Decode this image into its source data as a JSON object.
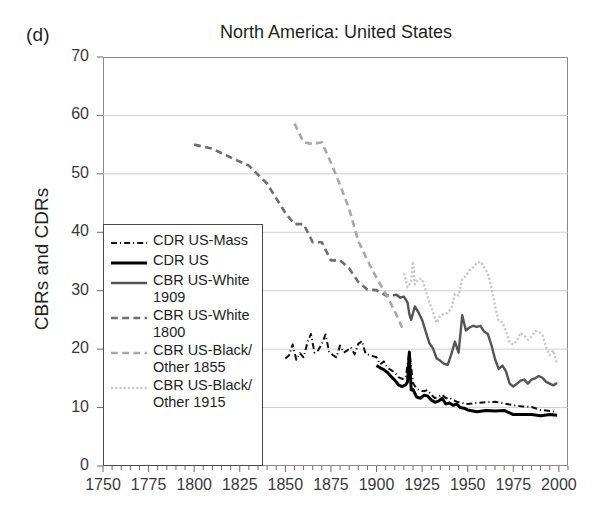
{
  "panel": {
    "label": "(d)"
  },
  "chart_data": {
    "type": "line",
    "title": "North America: United States",
    "xlabel": "",
    "ylabel": "CBRs and CDRs",
    "xlim": [
      1750,
      2005
    ],
    "ylim": [
      0,
      70
    ],
    "xticks": [
      1750,
      1775,
      1800,
      1825,
      1850,
      1875,
      1900,
      1925,
      1950,
      1975,
      2000
    ],
    "xtick_labels": [
      "1750",
      "1775",
      "1800",
      "1825",
      "1850",
      "1875",
      "1900",
      "1925",
      "1950",
      "1975",
      "2000"
    ],
    "minor_tick_step": 5,
    "yticks": [
      0,
      10,
      20,
      30,
      40,
      50,
      60,
      70
    ],
    "ytick_labels": [
      "0",
      "10",
      "20",
      "30",
      "40",
      "50",
      "60",
      "70"
    ],
    "grid": "horizontal",
    "legend_position": "lower-left-inside",
    "series": [
      {
        "name": "CDR US-Mass",
        "label": "CDR US-Mass",
        "style": "dash-dot",
        "color": "#111111",
        "width": 2.0,
        "x": [
          1850,
          1852,
          1854,
          1856,
          1858,
          1860,
          1862,
          1864,
          1866,
          1868,
          1870,
          1872,
          1874,
          1876,
          1878,
          1880,
          1882,
          1884,
          1886,
          1888,
          1890,
          1892,
          1894,
          1896,
          1898,
          1900,
          1902,
          1904,
          1906,
          1908,
          1910,
          1912,
          1914,
          1916,
          1918,
          1920,
          1922,
          1924,
          1926,
          1928,
          1930,
          1932,
          1934,
          1936,
          1938,
          1940,
          1942,
          1944,
          1946,
          1948,
          1950,
          1955,
          1960,
          1965,
          1970,
          1975,
          1980,
          1985,
          1990,
          1995,
          1999
        ],
        "y": [
          18.4,
          18.9,
          20.8,
          18.2,
          19.3,
          18.6,
          21.0,
          22.6,
          19.4,
          19.8,
          20.9,
          22.5,
          19.6,
          19.0,
          18.6,
          20.6,
          19.4,
          19.8,
          20.3,
          19.1,
          20.9,
          21.4,
          19.2,
          19.0,
          18.8,
          18.6,
          17.4,
          17.9,
          16.8,
          16.4,
          16.0,
          15.2,
          14.9,
          15.1,
          19.6,
          14.2,
          13.2,
          12.9,
          12.8,
          13.0,
          12.2,
          11.6,
          11.9,
          12.2,
          11.6,
          11.7,
          11.3,
          11.0,
          10.9,
          10.7,
          10.6,
          10.8,
          10.9,
          11.0,
          10.7,
          10.4,
          10.2,
          10.1,
          9.6,
          9.4,
          9.2
        ]
      },
      {
        "name": "CDR US",
        "label": "CDR US",
        "style": "solid",
        "color": "#000000",
        "width": 3.0,
        "x": [
          1900,
          1902,
          1904,
          1906,
          1908,
          1910,
          1912,
          1914,
          1916,
          1917,
          1918,
          1919,
          1920,
          1922,
          1924,
          1926,
          1928,
          1930,
          1932,
          1934,
          1936,
          1938,
          1940,
          1942,
          1944,
          1946,
          1948,
          1950,
          1955,
          1960,
          1965,
          1970,
          1975,
          1980,
          1985,
          1990,
          1995,
          1999
        ],
        "y": [
          17.2,
          16.8,
          16.5,
          16.0,
          15.3,
          14.7,
          13.9,
          13.6,
          13.9,
          14.4,
          19.5,
          13.0,
          13.1,
          11.8,
          11.6,
          12.1,
          12.0,
          11.3,
          10.9,
          11.1,
          11.6,
          10.6,
          10.8,
          10.4,
          10.6,
          10.0,
          9.9,
          9.6,
          9.3,
          9.5,
          9.4,
          9.5,
          8.8,
          8.8,
          8.8,
          8.6,
          8.8,
          8.7
        ]
      },
      {
        "name": "CBR US-White 1909",
        "label": "CBR US-White\n1909",
        "style": "solid",
        "color": "#555555",
        "width": 2.4,
        "x": [
          1909,
          1911,
          1913,
          1915,
          1917,
          1918,
          1919,
          1921,
          1923,
          1925,
          1927,
          1929,
          1931,
          1933,
          1935,
          1937,
          1939,
          1941,
          1943,
          1945,
          1947,
          1949,
          1951,
          1953,
          1955,
          1957,
          1959,
          1961,
          1963,
          1965,
          1967,
          1969,
          1971,
          1973,
          1975,
          1977,
          1979,
          1981,
          1983,
          1985,
          1987,
          1989,
          1991,
          1993,
          1995,
          1997,
          1999
        ],
        "y": [
          29.2,
          29.3,
          28.8,
          29.0,
          28.0,
          26.0,
          25.0,
          27.3,
          26.3,
          25.0,
          23.0,
          21.0,
          20.1,
          18.4,
          18.0,
          17.5,
          17.3,
          19.1,
          21.3,
          19.4,
          25.8,
          23.2,
          23.7,
          24.0,
          23.8,
          24.0,
          23.0,
          22.6,
          20.7,
          18.3,
          16.6,
          17.2,
          16.2,
          14.1,
          13.6,
          14.1,
          14.6,
          14.8,
          14.1,
          14.8,
          15.0,
          15.4,
          15.1,
          14.4,
          14.1,
          13.8,
          14.2
        ]
      },
      {
        "name": "CBR US-White 1800",
        "label": "CBR US-White\n1800",
        "style": "dashed",
        "color": "#6e6e6e",
        "width": 2.6,
        "x": [
          1800,
          1810,
          1820,
          1830,
          1840,
          1850,
          1855,
          1860,
          1865,
          1870,
          1875,
          1880,
          1885,
          1890,
          1895,
          1900,
          1905,
          1909
        ],
        "y": [
          55.0,
          54.3,
          52.8,
          51.4,
          48.3,
          43.3,
          41.4,
          41.4,
          38.3,
          38.3,
          35.2,
          35.2,
          33.8,
          31.5,
          30.2,
          30.1,
          29.2,
          29.2
        ]
      },
      {
        "name": "CBR US-Black/Other 1855",
        "label": "CBR US-Black/\nOther 1855",
        "style": "dashed",
        "color": "#a8a8a8",
        "width": 2.6,
        "x": [
          1855,
          1860,
          1865,
          1870,
          1875,
          1880,
          1885,
          1890,
          1895,
          1900,
          1905,
          1910,
          1915
        ],
        "y": [
          58.6,
          55.4,
          55.1,
          55.4,
          51.9,
          48.1,
          44.0,
          38.5,
          35.2,
          32.2,
          29.5,
          26.5,
          23.0
        ]
      },
      {
        "name": "CBR US-Black/Other 1915",
        "label": "CBR US-Black/\nOther 1915",
        "style": "dotted",
        "color": "#c9c9c9",
        "width": 2.4,
        "x": [
          1915,
          1917,
          1919,
          1920,
          1921,
          1923,
          1925,
          1927,
          1929,
          1931,
          1933,
          1935,
          1937,
          1939,
          1941,
          1943,
          1945,
          1947,
          1949,
          1951,
          1953,
          1955,
          1957,
          1959,
          1961,
          1963,
          1965,
          1967,
          1969,
          1971,
          1973,
          1975,
          1977,
          1979,
          1981,
          1983,
          1985,
          1987,
          1989,
          1991,
          1993,
          1995,
          1997,
          1999
        ],
        "y": [
          33.0,
          30.6,
          31.6,
          35.0,
          31.1,
          32.0,
          32.0,
          30.0,
          28.0,
          26.3,
          24.5,
          25.8,
          26.0,
          26.2,
          27.0,
          29.5,
          29.2,
          32.0,
          32.5,
          33.5,
          34.0,
          34.7,
          35.0,
          34.0,
          33.0,
          30.5,
          27.4,
          24.8,
          24.6,
          23.0,
          21.2,
          20.8,
          21.5,
          22.8,
          22.3,
          21.6,
          22.2,
          23.1,
          23.0,
          22.4,
          20.3,
          19.0,
          19.8,
          17.4
        ]
      }
    ]
  }
}
